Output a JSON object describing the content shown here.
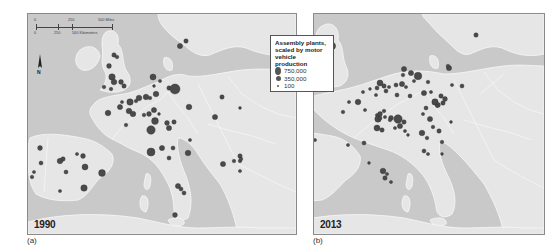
{
  "legend": {
    "title_lines": [
      "Assembly plants,",
      "scaled by motor",
      "vehicle production"
    ],
    "entries": [
      {
        "label": "750,000",
        "size": 6
      },
      {
        "label": "350,000",
        "size": 4
      },
      {
        "label": "100",
        "size": 1.6
      }
    ]
  },
  "scale_bar": {
    "miles": [
      "0",
      "250",
      "500 Miles"
    ],
    "kilometers": [
      "0",
      "250",
      "500 Kilometers"
    ]
  },
  "north_arrow": {
    "label": "N"
  },
  "panels": [
    {
      "id": "a",
      "caption": "(a)",
      "year": "1990",
      "plants": [
        {
          "x": 158,
          "y": 27,
          "r": 2.2
        },
        {
          "x": 152,
          "y": 32,
          "r": 2.6
        },
        {
          "x": 86,
          "y": 41,
          "r": 2.2
        },
        {
          "x": 89,
          "y": 43,
          "r": 1.8
        },
        {
          "x": 81,
          "y": 52,
          "r": 2.4
        },
        {
          "x": 84,
          "y": 63,
          "r": 3.2
        },
        {
          "x": 86,
          "y": 68,
          "r": 2.8
        },
        {
          "x": 93,
          "y": 68,
          "r": 2.4
        },
        {
          "x": 96,
          "y": 72,
          "r": 2.2
        },
        {
          "x": 76,
          "y": 73,
          "r": 1.8
        },
        {
          "x": 83,
          "y": 75,
          "r": 1.8
        },
        {
          "x": 125,
          "y": 63,
          "r": 3.0
        },
        {
          "x": 132,
          "y": 67,
          "r": 1.6
        },
        {
          "x": 126,
          "y": 72,
          "r": 1.4
        },
        {
          "x": 141,
          "y": 74,
          "r": 2.2
        },
        {
          "x": 147,
          "y": 75,
          "r": 5.0
        },
        {
          "x": 128,
          "y": 80,
          "r": 2.8
        },
        {
          "x": 122,
          "y": 84,
          "r": 1.8
        },
        {
          "x": 118,
          "y": 83,
          "r": 2.8
        },
        {
          "x": 111,
          "y": 84,
          "r": 2.8
        },
        {
          "x": 108,
          "y": 87,
          "r": 1.8
        },
        {
          "x": 102,
          "y": 88,
          "r": 3.2
        },
        {
          "x": 94,
          "y": 88,
          "r": 1.6
        },
        {
          "x": 92,
          "y": 93,
          "r": 2.6
        },
        {
          "x": 101,
          "y": 97,
          "r": 2.8
        },
        {
          "x": 105,
          "y": 100,
          "r": 2.8
        },
        {
          "x": 80,
          "y": 99,
          "r": 2.8
        },
        {
          "x": 98,
          "y": 111,
          "r": 1.8
        },
        {
          "x": 116,
          "y": 101,
          "r": 1.8
        },
        {
          "x": 121,
          "y": 100,
          "r": 2.4
        },
        {
          "x": 126,
          "y": 96,
          "r": 2.6
        },
        {
          "x": 127,
          "y": 107,
          "r": 3.4
        },
        {
          "x": 131,
          "y": 100,
          "r": 1.4
        },
        {
          "x": 139,
          "y": 109,
          "r": 2.4
        },
        {
          "x": 146,
          "y": 108,
          "r": 2.2
        },
        {
          "x": 141,
          "y": 114,
          "r": 2.6
        },
        {
          "x": 123,
          "y": 116,
          "r": 4.2
        },
        {
          "x": 161,
          "y": 93,
          "r": 2.8
        },
        {
          "x": 187,
          "y": 103,
          "r": 2.6
        },
        {
          "x": 194,
          "y": 83,
          "r": 2.2
        },
        {
          "x": 212,
          "y": 94,
          "r": 1.4
        },
        {
          "x": 123,
          "y": 138,
          "r": 4.0
        },
        {
          "x": 134,
          "y": 134,
          "r": 2.6
        },
        {
          "x": 145,
          "y": 134,
          "r": 2.0
        },
        {
          "x": 141,
          "y": 144,
          "r": 2.0
        },
        {
          "x": 160,
          "y": 139,
          "r": 2.8
        },
        {
          "x": 162,
          "y": 126,
          "r": 1.6
        },
        {
          "x": 12,
          "y": 134,
          "r": 2.4
        },
        {
          "x": 13,
          "y": 149,
          "r": 2.0
        },
        {
          "x": 32,
          "y": 147,
          "r": 2.8
        },
        {
          "x": 35,
          "y": 145,
          "r": 2.2
        },
        {
          "x": 49,
          "y": 140,
          "r": 1.6
        },
        {
          "x": 55,
          "y": 142,
          "r": 2.4
        },
        {
          "x": 57,
          "y": 153,
          "r": 3.0
        },
        {
          "x": 38,
          "y": 158,
          "r": 2.0
        },
        {
          "x": 74,
          "y": 159,
          "r": 3.4
        },
        {
          "x": 56,
          "y": 174,
          "r": 3.2
        },
        {
          "x": 32,
          "y": 177,
          "r": 1.6
        },
        {
          "x": 6,
          "y": 158,
          "r": 1.6
        },
        {
          "x": 4,
          "y": 163,
          "r": 1.8
        },
        {
          "x": 150,
          "y": 172,
          "r": 2.6
        },
        {
          "x": 153,
          "y": 175,
          "r": 2.0
        },
        {
          "x": 156,
          "y": 179,
          "r": 2.0
        },
        {
          "x": 147,
          "y": 201,
          "r": 2.4
        },
        {
          "x": 195,
          "y": 150,
          "r": 2.6
        },
        {
          "x": 212,
          "y": 142,
          "r": 2.2
        },
        {
          "x": 212,
          "y": 147,
          "r": 1.8
        },
        {
          "x": 213,
          "y": 145,
          "r": 1.8
        },
        {
          "x": 206,
          "y": 147,
          "r": 1.8
        },
        {
          "x": 212,
          "y": 157,
          "r": 1.6
        }
      ]
    },
    {
      "id": "b",
      "caption": "(b)",
      "year": "2013",
      "plants": [
        {
          "x": 162,
          "y": 21,
          "r": 2.2
        },
        {
          "x": 18,
          "y": 32,
          "r": 3.6
        },
        {
          "x": 7,
          "y": 43,
          "r": 2.4
        },
        {
          "x": 10,
          "y": 48,
          "r": 2.6
        },
        {
          "x": 9,
          "y": 54,
          "r": 2.2
        },
        {
          "x": 12,
          "y": 57,
          "r": 1.8
        },
        {
          "x": 8,
          "y": 58,
          "r": 2.4
        },
        {
          "x": 16,
          "y": 59,
          "r": 1.6
        },
        {
          "x": 9,
          "y": 63,
          "r": 1.6
        },
        {
          "x": 135,
          "y": 54,
          "r": 2.6
        },
        {
          "x": 134,
          "y": 52,
          "r": 1.8
        },
        {
          "x": 90,
          "y": 55,
          "r": 2.6
        },
        {
          "x": 97,
          "y": 59,
          "r": 2.6
        },
        {
          "x": 104,
          "y": 62,
          "r": 3.8
        },
        {
          "x": 89,
          "y": 61,
          "r": 1.8
        },
        {
          "x": 100,
          "y": 67,
          "r": 1.6
        },
        {
          "x": 114,
          "y": 68,
          "r": 1.8
        },
        {
          "x": 66,
          "y": 69,
          "r": 3.0
        },
        {
          "x": 70,
          "y": 72,
          "r": 2.2
        },
        {
          "x": 75,
          "y": 73,
          "r": 1.6
        },
        {
          "x": 82,
          "y": 71,
          "r": 2.0
        },
        {
          "x": 88,
          "y": 70,
          "r": 2.6
        },
        {
          "x": 92,
          "y": 73,
          "r": 1.6
        },
        {
          "x": 63,
          "y": 74,
          "r": 2.0
        },
        {
          "x": 72,
          "y": 77,
          "r": 2.0
        },
        {
          "x": 49,
          "y": 78,
          "r": 1.6
        },
        {
          "x": 56,
          "y": 75,
          "r": 1.4
        },
        {
          "x": 62,
          "y": 81,
          "r": 1.6
        },
        {
          "x": 83,
          "y": 81,
          "r": 2.0
        },
        {
          "x": 96,
          "y": 82,
          "r": 2.0
        },
        {
          "x": 110,
          "y": 79,
          "r": 2.6
        },
        {
          "x": 117,
          "y": 78,
          "r": 1.6
        },
        {
          "x": 121,
          "y": 88,
          "r": 3.2
        },
        {
          "x": 124,
          "y": 91,
          "r": 2.4
        },
        {
          "x": 129,
          "y": 89,
          "r": 2.2
        },
        {
          "x": 112,
          "y": 94,
          "r": 2.0
        },
        {
          "x": 138,
          "y": 71,
          "r": 1.6
        },
        {
          "x": 148,
          "y": 72,
          "r": 2.0
        },
        {
          "x": 127,
          "y": 82,
          "r": 2.2
        },
        {
          "x": 131,
          "y": 85,
          "r": 2.4
        },
        {
          "x": 29,
          "y": 98,
          "r": 1.8
        },
        {
          "x": 35,
          "y": 88,
          "r": 1.6
        },
        {
          "x": 44,
          "y": 88,
          "r": 2.8
        },
        {
          "x": 51,
          "y": 96,
          "r": 1.6
        },
        {
          "x": 63,
          "y": 101,
          "r": 1.6
        },
        {
          "x": 70,
          "y": 97,
          "r": 1.8
        },
        {
          "x": 64,
          "y": 105,
          "r": 3.2
        },
        {
          "x": 66,
          "y": 104,
          "r": 2.0
        },
        {
          "x": 71,
          "y": 103,
          "r": 1.6
        },
        {
          "x": 66,
          "y": 100,
          "r": 2.4
        },
        {
          "x": 77,
          "y": 104,
          "r": 2.4
        },
        {
          "x": 76,
          "y": 106,
          "r": 1.8
        },
        {
          "x": 84,
          "y": 105,
          "r": 4.2
        },
        {
          "x": 86,
          "y": 112,
          "r": 2.6
        },
        {
          "x": 90,
          "y": 108,
          "r": 2.2
        },
        {
          "x": 81,
          "y": 114,
          "r": 1.6
        },
        {
          "x": 63,
          "y": 114,
          "r": 3.0
        },
        {
          "x": 68,
          "y": 116,
          "r": 2.2
        },
        {
          "x": 91,
          "y": 117,
          "r": 1.6
        },
        {
          "x": 94,
          "y": 121,
          "r": 1.4
        },
        {
          "x": 108,
          "y": 119,
          "r": 2.8
        },
        {
          "x": 113,
          "y": 124,
          "r": 1.8
        },
        {
          "x": 116,
          "y": 105,
          "r": 2.6
        },
        {
          "x": 119,
          "y": 113,
          "r": 1.8
        },
        {
          "x": 125,
          "y": 117,
          "r": 2.2
        },
        {
          "x": 128,
          "y": 128,
          "r": 1.8
        },
        {
          "x": 123,
          "y": 92,
          "r": 1.6
        },
        {
          "x": 137,
          "y": 108,
          "r": 1.4
        },
        {
          "x": 109,
          "y": 100,
          "r": 1.6
        },
        {
          "x": 34,
          "y": 131,
          "r": 1.6
        },
        {
          "x": 50,
          "y": 129,
          "r": 2.0
        },
        {
          "x": 110,
          "y": 137,
          "r": 2.0
        },
        {
          "x": 114,
          "y": 140,
          "r": 1.6
        },
        {
          "x": 1,
          "y": 126,
          "r": 1.6
        },
        {
          "x": 128,
          "y": 140,
          "r": 1.4
        },
        {
          "x": 69,
          "y": 157,
          "r": 2.8
        },
        {
          "x": 71,
          "y": 164,
          "r": 2.2
        },
        {
          "x": 73,
          "y": 160,
          "r": 1.6
        },
        {
          "x": 77,
          "y": 168,
          "r": 1.6
        },
        {
          "x": 55,
          "y": 149,
          "r": 1.4
        },
        {
          "x": -262,
          "y": 0,
          "r": 0
        }
      ]
    }
  ]
}
